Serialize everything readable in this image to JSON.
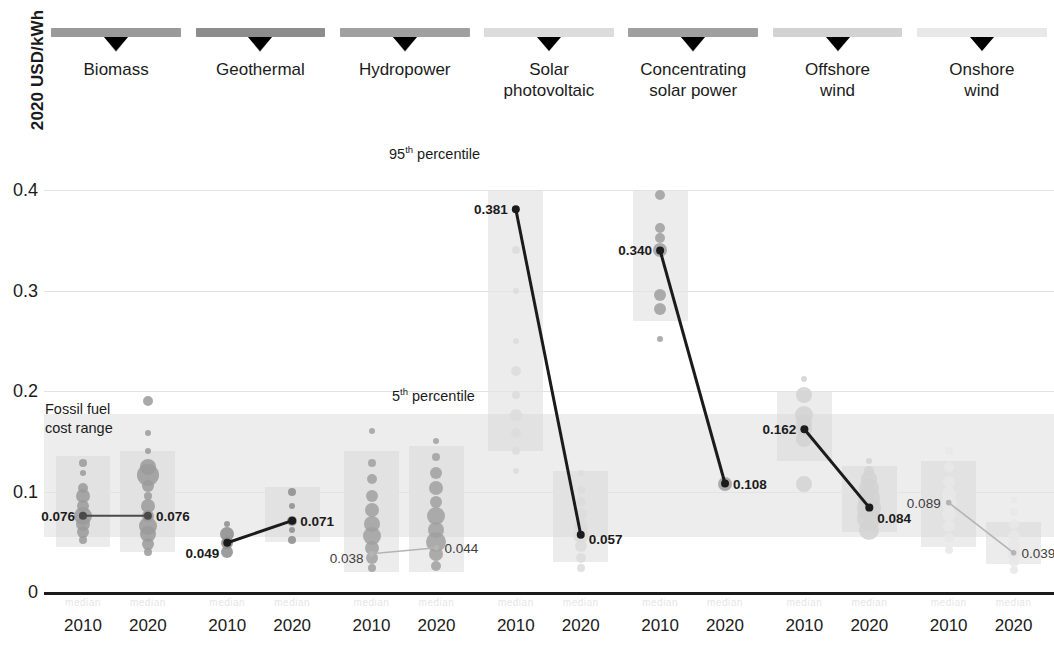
{
  "axis": {
    "y_title": "2020 USD/kWh",
    "y_ticks": [
      "0.4",
      "0.3",
      "0.2",
      "0.1",
      "0"
    ],
    "y_tick_values": [
      0.4,
      0.3,
      0.2,
      0.1,
      0
    ],
    "x_ticks": [
      "2010",
      "2020",
      "2010",
      "2020",
      "2010",
      "2020",
      "2010",
      "2020",
      "2010",
      "2020",
      "2010",
      "2020",
      "2010",
      "2020"
    ]
  },
  "annotations": {
    "p95": "95",
    "p95_sup": "th",
    "p95_rest": " percentile",
    "p5": "5",
    "p5_sup": "th",
    "p5_rest": " percentile",
    "fossil_line1": "Fossil fuel",
    "fossil_line2": "cost range"
  },
  "colors": {
    "biomass": "#9a9a9a",
    "geothermal": "#8c8c8c",
    "hydropower": "#a0a0a0",
    "solar_pv": "#dcdcdc",
    "csp": "#9f9f9f",
    "offshore_wind": "#d2d2d2",
    "onshore_wind": "#e8e8e8",
    "line_dark": "#1b1b1b",
    "line_mid": "#4a4a4a",
    "line_light": "#b4b4b4",
    "grid": "#e3e3e3",
    "band": "#dcdcdc"
  },
  "chart_data": {
    "type": "scatter",
    "title": "",
    "xlabel": "",
    "ylabel": "2020 USD/kWh",
    "ylim": [
      0,
      0.44
    ],
    "grid": true,
    "legend": "none",
    "technologies": [
      {
        "name": "Biomass",
        "label_lines": [
          "Biomass"
        ],
        "color": "#9a9a9a",
        "line_weight": "medium",
        "years": [
          "2010",
          "2020"
        ],
        "values": [
          0.076,
          0.076
        ],
        "value_labels": [
          "0.076",
          "0.076"
        ],
        "percentile_band_2010": [
          0.045,
          0.135
        ],
        "percentile_band_2020": [
          0.04,
          0.14
        ],
        "bubbles_2010": [
          {
            "y": 0.128,
            "r": 4
          },
          {
            "y": 0.118,
            "r": 3
          },
          {
            "y": 0.104,
            "r": 5
          },
          {
            "y": 0.096,
            "r": 7
          },
          {
            "y": 0.086,
            "r": 6
          },
          {
            "y": 0.076,
            "r": 9
          },
          {
            "y": 0.068,
            "r": 7
          },
          {
            "y": 0.06,
            "r": 6
          },
          {
            "y": 0.052,
            "r": 4
          }
        ],
        "bubbles_2020": [
          {
            "y": 0.19,
            "r": 5
          },
          {
            "y": 0.158,
            "r": 3
          },
          {
            "y": 0.14,
            "r": 3
          },
          {
            "y": 0.124,
            "r": 8
          },
          {
            "y": 0.116,
            "r": 11
          },
          {
            "y": 0.106,
            "r": 6
          },
          {
            "y": 0.096,
            "r": 4
          },
          {
            "y": 0.086,
            "r": 7
          },
          {
            "y": 0.076,
            "r": 6
          },
          {
            "y": 0.066,
            "r": 9
          },
          {
            "y": 0.058,
            "r": 8
          },
          {
            "y": 0.048,
            "r": 6
          },
          {
            "y": 0.04,
            "r": 4
          }
        ]
      },
      {
        "name": "Geothermal",
        "label_lines": [
          "Geothermal"
        ],
        "color": "#8c8c8c",
        "line_weight": "heavy",
        "years": [
          "2010",
          "2020"
        ],
        "values": [
          0.049,
          0.071
        ],
        "value_labels": [
          "0.049",
          "0.071"
        ],
        "percentile_band_2010": null,
        "percentile_band_2020": [
          0.05,
          0.105
        ],
        "bubbles_2010": [
          {
            "y": 0.068,
            "r": 3
          },
          {
            "y": 0.058,
            "r": 7
          },
          {
            "y": 0.049,
            "r": 6
          },
          {
            "y": 0.04,
            "r": 6
          }
        ],
        "bubbles_2020": [
          {
            "y": 0.1,
            "r": 4
          },
          {
            "y": 0.086,
            "r": 3
          },
          {
            "y": 0.071,
            "r": 5
          },
          {
            "y": 0.062,
            "r": 3
          },
          {
            "y": 0.052,
            "r": 4
          }
        ]
      },
      {
        "name": "Hydropower",
        "label_lines": [
          "Hydropower"
        ],
        "color": "#a0a0a0",
        "line_weight": "light",
        "years": [
          "2010",
          "2020"
        ],
        "values": [
          0.038,
          0.044
        ],
        "value_labels": [
          "0.038",
          "0.044"
        ],
        "percentile_band_2010": [
          0.02,
          0.14
        ],
        "percentile_band_2020": [
          0.02,
          0.145
        ],
        "bubbles_2010": [
          {
            "y": 0.16,
            "r": 3
          },
          {
            "y": 0.128,
            "r": 4
          },
          {
            "y": 0.112,
            "r": 5
          },
          {
            "y": 0.096,
            "r": 6
          },
          {
            "y": 0.082,
            "r": 7
          },
          {
            "y": 0.068,
            "r": 8
          },
          {
            "y": 0.056,
            "r": 9
          },
          {
            "y": 0.044,
            "r": 7
          },
          {
            "y": 0.034,
            "r": 6
          },
          {
            "y": 0.024,
            "r": 4
          }
        ],
        "bubbles_2020": [
          {
            "y": 0.15,
            "r": 3
          },
          {
            "y": 0.134,
            "r": 4
          },
          {
            "y": 0.118,
            "r": 6
          },
          {
            "y": 0.104,
            "r": 7
          },
          {
            "y": 0.09,
            "r": 6
          },
          {
            "y": 0.076,
            "r": 9
          },
          {
            "y": 0.062,
            "r": 8
          },
          {
            "y": 0.05,
            "r": 10
          },
          {
            "y": 0.038,
            "r": 7
          },
          {
            "y": 0.026,
            "r": 5
          }
        ]
      },
      {
        "name": "Solar photovoltaic",
        "label_lines": [
          "Solar",
          "photovoltaic"
        ],
        "color": "#dcdcdc",
        "line_weight": "heavy",
        "years": [
          "2010",
          "2020"
        ],
        "values": [
          0.381,
          0.057
        ],
        "value_labels": [
          "0.381",
          "0.057"
        ],
        "percentile_band_2010": [
          0.14,
          0.4
        ],
        "percentile_band_2020": [
          0.03,
          0.12
        ],
        "bubbles_2010": [
          {
            "y": 0.34,
            "r": 4
          },
          {
            "y": 0.3,
            "r": 3
          },
          {
            "y": 0.25,
            "r": 3
          },
          {
            "y": 0.22,
            "r": 5
          },
          {
            "y": 0.196,
            "r": 4
          },
          {
            "y": 0.176,
            "r": 6
          },
          {
            "y": 0.158,
            "r": 5
          },
          {
            "y": 0.14,
            "r": 4
          },
          {
            "y": 0.12,
            "r": 3
          }
        ],
        "bubbles_2020": [
          {
            "y": 0.118,
            "r": 3
          },
          {
            "y": 0.102,
            "r": 4
          },
          {
            "y": 0.09,
            "r": 5
          },
          {
            "y": 0.078,
            "r": 6
          },
          {
            "y": 0.066,
            "r": 7
          },
          {
            "y": 0.057,
            "r": 8
          },
          {
            "y": 0.046,
            "r": 6
          },
          {
            "y": 0.034,
            "r": 5
          },
          {
            "y": 0.024,
            "r": 4
          }
        ]
      },
      {
        "name": "Concentrating solar power",
        "label_lines": [
          "Concentrating",
          "solar power"
        ],
        "color": "#9f9f9f",
        "line_weight": "heavy",
        "years": [
          "2010",
          "2020"
        ],
        "values": [
          0.34,
          0.108
        ],
        "value_labels": [
          "0.340",
          "0.108"
        ],
        "percentile_band_2010": [
          0.27,
          0.4
        ],
        "percentile_band_2020": null,
        "bubbles_2010": [
          {
            "y": 0.395,
            "r": 5
          },
          {
            "y": 0.362,
            "r": 5
          },
          {
            "y": 0.352,
            "r": 5
          },
          {
            "y": 0.34,
            "r": 7
          },
          {
            "y": 0.296,
            "r": 6
          },
          {
            "y": 0.282,
            "r": 6
          },
          {
            "y": 0.252,
            "r": 3
          }
        ],
        "bubbles_2020": [
          {
            "y": 0.108,
            "r": 7
          }
        ]
      },
      {
        "name": "Offshore wind",
        "label_lines": [
          "Offshore",
          "wind"
        ],
        "color": "#d2d2d2",
        "line_weight": "heavy",
        "years": [
          "2010",
          "2020"
        ],
        "values": [
          0.162,
          0.084
        ],
        "value_labels": [
          "0.162",
          "0.084"
        ],
        "percentile_band_2010": [
          0.13,
          0.2
        ],
        "percentile_band_2020": [
          0.06,
          0.125
        ],
        "bubbles_2010": [
          {
            "y": 0.212,
            "r": 3
          },
          {
            "y": 0.196,
            "r": 8
          },
          {
            "y": 0.176,
            "r": 9
          },
          {
            "y": 0.168,
            "r": 8
          },
          {
            "y": 0.162,
            "r": 8
          },
          {
            "y": 0.152,
            "r": 8
          },
          {
            "y": 0.108,
            "r": 8
          }
        ],
        "bubbles_2020": [
          {
            "y": 0.13,
            "r": 3
          },
          {
            "y": 0.12,
            "r": 5
          },
          {
            "y": 0.112,
            "r": 8
          },
          {
            "y": 0.104,
            "r": 10
          },
          {
            "y": 0.094,
            "r": 11
          },
          {
            "y": 0.084,
            "r": 12
          },
          {
            "y": 0.074,
            "r": 12
          },
          {
            "y": 0.062,
            "r": 10
          }
        ]
      },
      {
        "name": "Onshore wind",
        "label_lines": [
          "Onshore",
          "wind"
        ],
        "color": "#e8e8e8",
        "line_weight": "light",
        "years": [
          "2010",
          "2020"
        ],
        "values": [
          0.089,
          0.039
        ],
        "value_labels": [
          "0.089",
          "0.039"
        ],
        "percentile_band_2010": [
          0.045,
          0.13
        ],
        "percentile_band_2020": [
          0.028,
          0.07
        ],
        "bubbles_2010": [
          {
            "y": 0.14,
            "r": 4
          },
          {
            "y": 0.124,
            "r": 5
          },
          {
            "y": 0.11,
            "r": 6
          },
          {
            "y": 0.098,
            "r": 7
          },
          {
            "y": 0.089,
            "r": 8
          },
          {
            "y": 0.078,
            "r": 7
          },
          {
            "y": 0.066,
            "r": 6
          },
          {
            "y": 0.054,
            "r": 5
          },
          {
            "y": 0.042,
            "r": 4
          }
        ],
        "bubbles_2020": [
          {
            "y": 0.092,
            "r": 3
          },
          {
            "y": 0.08,
            "r": 4
          },
          {
            "y": 0.068,
            "r": 5
          },
          {
            "y": 0.056,
            "r": 6
          },
          {
            "y": 0.046,
            "r": 6
          },
          {
            "y": 0.039,
            "r": 7
          },
          {
            "y": 0.03,
            "r": 5
          },
          {
            "y": 0.022,
            "r": 4
          }
        ]
      }
    ],
    "fossil_fuel_band": [
      0.055,
      0.177
    ]
  }
}
